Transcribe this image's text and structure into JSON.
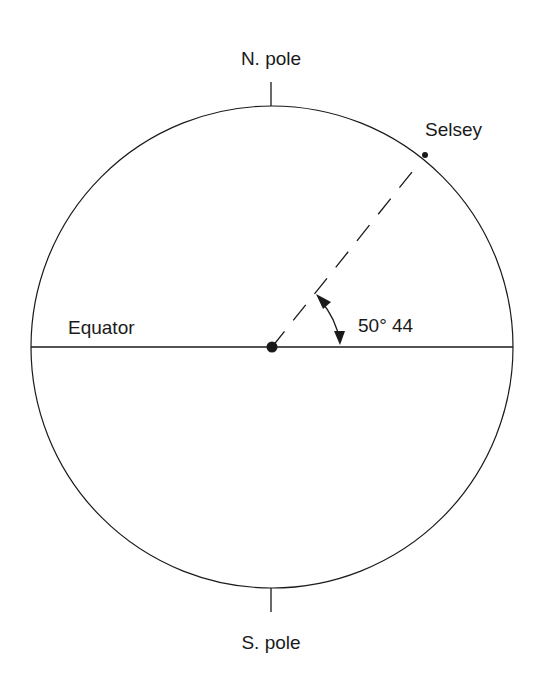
{
  "diagram": {
    "labels": {
      "north_pole": "N. pole",
      "south_pole": "S. pole",
      "equator": "Equator",
      "location": "Selsey",
      "angle": "50° 44"
    },
    "latitude_degrees": 50,
    "latitude_minutes": 44,
    "colors": {
      "line": "#1a1a1a",
      "background": "#ffffff"
    }
  }
}
